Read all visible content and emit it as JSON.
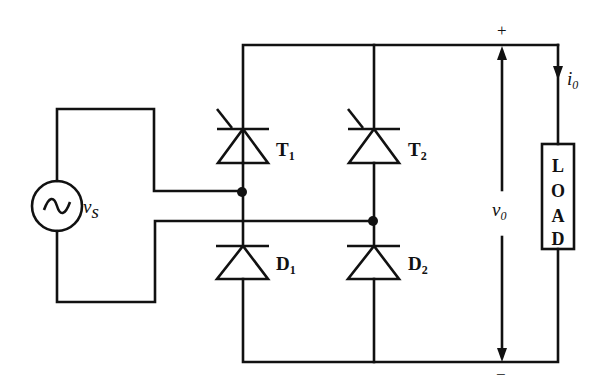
{
  "diagram": {
    "type": "single-phase half-controlled bridge rectifier circuit",
    "source": {
      "label": "v",
      "subscript": "s",
      "symbol": "ac-sine"
    },
    "thyristors": [
      {
        "label": "T",
        "subscript": "1"
      },
      {
        "label": "T",
        "subscript": "2"
      }
    ],
    "diodes": [
      {
        "label": "D",
        "subscript": "1"
      },
      {
        "label": "D",
        "subscript": "2"
      }
    ],
    "output_voltage": {
      "label": "v",
      "subscript": "0",
      "plus": "+",
      "minus": "−"
    },
    "output_current": {
      "label": "i",
      "subscript": "0"
    },
    "load": {
      "letters": [
        "L",
        "O",
        "A",
        "D"
      ]
    }
  }
}
